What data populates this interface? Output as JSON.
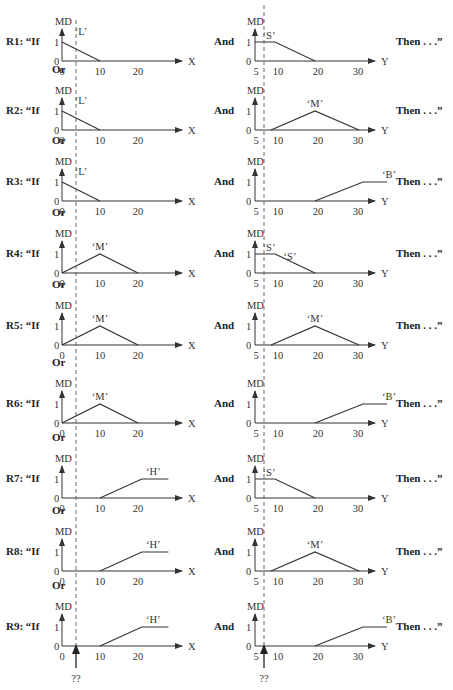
{
  "figure": {
    "left_axis_label": "X",
    "right_axis_label": "Y",
    "md_label": "MD",
    "connector_if": "If",
    "connector_and": "And",
    "connector_or": "Or",
    "then_label": "Then . . .”",
    "unknown_marker": "??",
    "left_ticks": [
      "0",
      "10",
      "20"
    ],
    "right_ticks": [
      "5",
      "10",
      "20",
      "30"
    ],
    "y_ticks": [
      "0",
      "1"
    ],
    "left_dashed_x": 3.7,
    "right_dashed_y": 8
  },
  "rules": [
    {
      "id": "R1",
      "label": "R1: “If",
      "x_set": "L",
      "y_set": "S"
    },
    {
      "id": "R2",
      "label": "R2: “If",
      "x_set": "L",
      "y_set": "M"
    },
    {
      "id": "R3",
      "label": "R3: “If",
      "x_set": "L",
      "y_set": "B"
    },
    {
      "id": "R4",
      "label": "R4: “If",
      "x_set": "M",
      "y_set": "S"
    },
    {
      "id": "R5",
      "label": "R5: “If",
      "x_set": "M",
      "y_set": "M"
    },
    {
      "id": "R6",
      "label": "R6: “If",
      "x_set": "M",
      "y_set": "B"
    },
    {
      "id": "R7",
      "label": "R7: “If",
      "x_set": "H",
      "y_set": "S"
    },
    {
      "id": "R8",
      "label": "R8: “If",
      "x_set": "H",
      "y_set": "M"
    },
    {
      "id": "R9",
      "label": "R9: “If",
      "x_set": "H",
      "y_set": "B"
    }
  ],
  "set_labels": {
    "L": "‘L’",
    "M": "‘M’",
    "H": "‘H’",
    "S": "‘S’",
    "B": "‘B’"
  },
  "membership_functions": {
    "x": {
      "L": [
        [
          0,
          1
        ],
        [
          10,
          0
        ]
      ],
      "M": [
        [
          0,
          0
        ],
        [
          10,
          1
        ],
        [
          20,
          0
        ]
      ],
      "H": [
        [
          10,
          0
        ],
        [
          21,
          1
        ],
        [
          28,
          1
        ]
      ]
    },
    "y": {
      "S": [
        [
          5,
          1
        ],
        [
          10,
          1
        ],
        [
          20,
          0
        ]
      ],
      "M": [
        [
          9,
          0
        ],
        [
          20,
          1
        ],
        [
          31,
          0
        ]
      ],
      "B": [
        [
          20,
          0
        ],
        [
          32,
          1
        ],
        [
          38,
          1
        ]
      ]
    }
  }
}
